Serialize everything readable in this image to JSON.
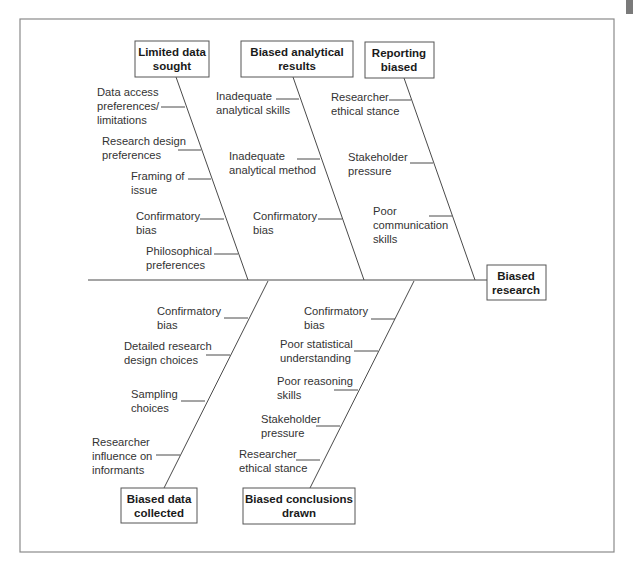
{
  "diagram": {
    "type": "fishbone",
    "effect": {
      "line1": "Biased",
      "line2": "research"
    },
    "top_categories": [
      {
        "line1": "Limited data",
        "line2": "sought",
        "causes": [
          {
            "lines": [
              "Data access",
              "preferences/",
              "limitations"
            ]
          },
          {
            "lines": [
              "Research design",
              "preferences"
            ]
          },
          {
            "lines": [
              "Framing of",
              "issue"
            ]
          },
          {
            "lines": [
              "Confirmatory",
              "bias"
            ]
          },
          {
            "lines": [
              "Philosophical",
              "preferences"
            ]
          }
        ]
      },
      {
        "line1": "Biased analytical",
        "line2": "results",
        "causes": [
          {
            "lines": [
              "Inadequate",
              "analytical skills"
            ]
          },
          {
            "lines": [
              "Inadequate",
              "analytical method"
            ]
          },
          {
            "lines": [
              "Confirmatory",
              "bias"
            ]
          }
        ]
      },
      {
        "line1": "Reporting",
        "line2": "biased",
        "causes": [
          {
            "lines": [
              "Researcher",
              "ethical stance"
            ]
          },
          {
            "lines": [
              "Stakeholder",
              "pressure"
            ]
          },
          {
            "lines": [
              "Poor",
              "communication",
              "skills"
            ]
          }
        ]
      }
    ],
    "bottom_categories": [
      {
        "line1": "Biased data",
        "line2": "collected",
        "causes": [
          {
            "lines": [
              "Confirmatory",
              "bias"
            ]
          },
          {
            "lines": [
              "Detailed research",
              "design choices"
            ]
          },
          {
            "lines": [
              "Sampling",
              "choices"
            ]
          },
          {
            "lines": [
              "Researcher",
              "influence on",
              "informants"
            ]
          }
        ]
      },
      {
        "line1": "Biased conclusions",
        "line2": "drawn",
        "causes": [
          {
            "lines": [
              "Confirmatory",
              "bias"
            ]
          },
          {
            "lines": [
              "Poor statistical",
              "understanding"
            ]
          },
          {
            "lines": [
              "Poor reasoning",
              "skills"
            ]
          },
          {
            "lines": [
              "Stakeholder",
              "pressure"
            ]
          },
          {
            "lines": [
              "Researcher",
              "ethical stance"
            ]
          }
        ]
      }
    ]
  },
  "colors": {
    "frame": "#8a8a8a",
    "line": "#4a4a4a",
    "text": "#333333",
    "heading": "#1a1a1a"
  }
}
